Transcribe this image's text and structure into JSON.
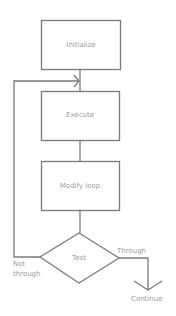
{
  "diagram": {
    "type": "flowchart",
    "colors": {
      "stroke": "#7a7a7a",
      "text": "#9a9a9a",
      "background": "#ffffff"
    },
    "nodes": {
      "initialize": {
        "label": "Initialize",
        "shape": "rectangle"
      },
      "execute": {
        "label": "Execute",
        "shape": "rectangle"
      },
      "modify": {
        "label": "Modify loop",
        "shape": "rectangle"
      },
      "test": {
        "label": "Test",
        "shape": "diamond"
      },
      "continue": {
        "label": "Continue",
        "shape": "terminal-text"
      }
    },
    "edges": {
      "through": {
        "label": "Through",
        "from": "Test",
        "to": "Continue"
      },
      "not_through_line1": "Not",
      "not_through_line2": "through"
    }
  }
}
